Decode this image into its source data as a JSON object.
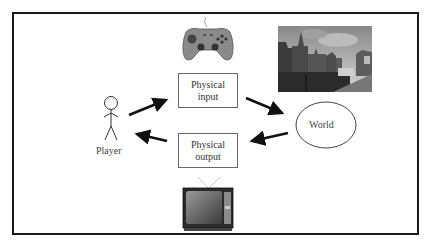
{
  "diagram": {
    "nodes": {
      "player": {
        "label": "Player"
      },
      "physical_input": {
        "line1": "Physical",
        "line2": "input"
      },
      "physical_output": {
        "line1": "Physical",
        "line2": "output"
      },
      "world": {
        "label": "World"
      }
    },
    "images": {
      "gamepad": "gamepad-icon",
      "city_photo": "city-canal-photo",
      "television": "television-icon",
      "player_figure": "stick-figure-icon"
    },
    "edges": [
      {
        "from": "Player",
        "to": "Physical input"
      },
      {
        "from": "Physical input",
        "to": "World"
      },
      {
        "from": "World",
        "to": "Physical output"
      },
      {
        "from": "Physical output",
        "to": "Player"
      }
    ],
    "colors": {
      "frame": "#1a1a1a",
      "arrow": "#111111",
      "box_border": "#666666"
    }
  }
}
